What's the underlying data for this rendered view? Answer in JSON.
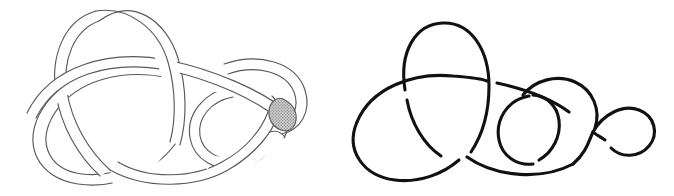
{
  "figure": {
    "background_color": "#ffffff",
    "width": 674,
    "height": 196,
    "panels": [
      {
        "id": "left",
        "name": "banded-knot-diagram",
        "style": "double-line band / ribbon (annulus neighbourhood)",
        "stroke_color": "#555a5e",
        "stroke_width": 1.15,
        "band_width": 10,
        "fill_color": "#ffffff",
        "crossing_count": 5,
        "has_shaded_region": true,
        "shaded_region": {
          "name": "shaded-lens-disk",
          "shape": "lens / bigon",
          "fill_color": "#b0b0b0",
          "pattern": "fine dot screen",
          "center_x": 283,
          "center_y": 114,
          "width": 26,
          "height": 30
        },
        "bounds": {
          "x": 35,
          "y": 10,
          "width": 265,
          "height": 175
        }
      },
      {
        "id": "right",
        "name": "curve-knot-diagram",
        "style": "single thick curve with broken under-strands",
        "stroke_color": "#111111",
        "stroke_width": 3.1,
        "crossing_count": 5,
        "has_shaded_region": false,
        "bounds": {
          "x": 363,
          "y": 22,
          "width": 290,
          "height": 160
        }
      }
    ],
    "colors": {
      "band_line": "#555a5e",
      "curve_line": "#111111",
      "shade_fill": "#b0b0b0",
      "paper": "#ffffff"
    }
  }
}
